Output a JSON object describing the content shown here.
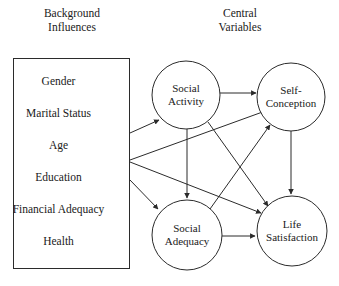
{
  "diagram": {
    "columns": {
      "background_title": "Background\nInfluences",
      "central_title": "Central\nVariables"
    },
    "background_box": {
      "items": [
        {
          "label": "Gender"
        },
        {
          "label": "Marital Status"
        },
        {
          "label": "Age"
        },
        {
          "label": "Education"
        },
        {
          "label": "Financial Adequacy"
        },
        {
          "label": "Health"
        }
      ]
    },
    "nodes": [
      {
        "id": "social-activity",
        "label": "Social\nActivity",
        "cx": 186,
        "cy": 95,
        "r": 34
      },
      {
        "id": "self-conception",
        "label": "Self-\nConception",
        "cx": 291,
        "cy": 97,
        "r": 34
      },
      {
        "id": "social-adequacy",
        "label": "Social\nAdequacy",
        "cx": 187,
        "cy": 235,
        "r": 35
      },
      {
        "id": "life-satisfaction",
        "label": "Life\nSatisfaction",
        "cx": 292,
        "cy": 231,
        "r": 35
      }
    ],
    "edges": [
      {
        "from": "background-influences",
        "to": "social-activity"
      },
      {
        "from": "background-influences",
        "to": "self-conception"
      },
      {
        "from": "background-influences",
        "to": "life-satisfaction"
      },
      {
        "from": "background-influences",
        "to": "social-adequacy"
      },
      {
        "from": "social-activity",
        "to": "self-conception"
      },
      {
        "from": "social-activity",
        "to": "social-adequacy"
      },
      {
        "from": "social-activity",
        "to": "life-satisfaction"
      },
      {
        "from": "social-adequacy",
        "to": "self-conception"
      },
      {
        "from": "social-adequacy",
        "to": "life-satisfaction"
      },
      {
        "from": "self-conception",
        "to": "life-satisfaction"
      }
    ],
    "colors": {
      "stroke": "#2b2b2b",
      "text": "#1a1a1a",
      "background": "#ffffff"
    }
  }
}
